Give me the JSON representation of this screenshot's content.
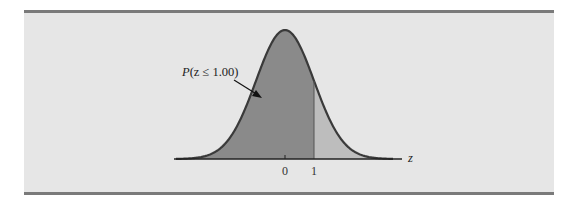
{
  "figure": {
    "annotation": "P(z ≤ 1.00)",
    "annotation_parts": {
      "p": "P",
      "rest": "(z ≤ 1.00)"
    },
    "axis_label": "z",
    "ticks": [
      {
        "value": 0,
        "label": "0"
      },
      {
        "value": 1,
        "label": "1"
      }
    ],
    "colors": {
      "background": "#e6e6e6",
      "rule": "#7a7a7a",
      "shaded_left": "#8a8a8a",
      "shaded_right": "#bdbdbd",
      "curve": "#3a3a3a",
      "axis": "#222222"
    }
  },
  "chart_data": {
    "type": "area",
    "title": "",
    "xlabel": "z",
    "ylabel": "",
    "x_ticks": [
      0,
      1
    ],
    "shaded_region": {
      "from": "-inf",
      "to": 1.0,
      "label": "P(z ≤ 1.00)"
    },
    "distribution": {
      "name": "standard normal",
      "mean": 0,
      "sd": 1
    },
    "grid": false,
    "legend": null
  }
}
